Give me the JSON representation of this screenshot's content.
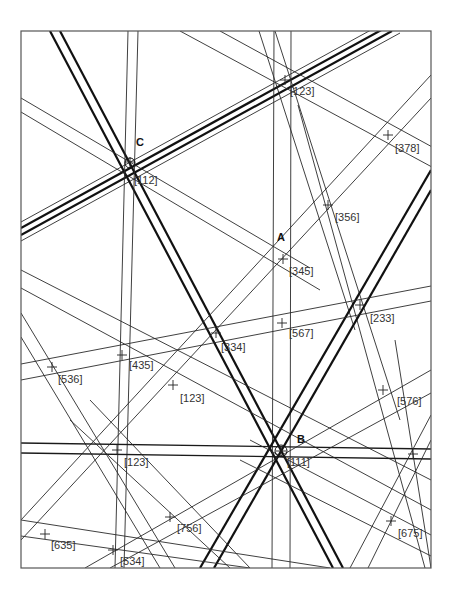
{
  "diagram": {
    "type": "kikuchi-map",
    "frame": {
      "x": 21,
      "y": 31,
      "width": 410,
      "height": 537
    },
    "poles": [
      {
        "id": "A",
        "label": "A",
        "x": 277,
        "y": 238
      },
      {
        "id": "B",
        "label": "B",
        "x": 297,
        "y": 440
      },
      {
        "id": "C",
        "label": "C",
        "x": 136,
        "y": 143
      }
    ],
    "zone_labels": [
      {
        "text": "[123]",
        "x": 290,
        "y": 95
      },
      {
        "text": "[378]",
        "x": 395,
        "y": 152
      },
      {
        "text": "[112]",
        "x": 134,
        "y": 184
      },
      {
        "text": "[356]",
        "x": 335,
        "y": 221
      },
      {
        "text": "[345]",
        "x": 289,
        "y": 275
      },
      {
        "text": "[233]",
        "x": 370,
        "y": 322
      },
      {
        "text": "[334]",
        "x": 221,
        "y": 351
      },
      {
        "text": "[567]",
        "x": 289,
        "y": 337
      },
      {
        "text": "[536]",
        "x": 58,
        "y": 383
      },
      {
        "text": "[435]",
        "x": 129,
        "y": 369
      },
      {
        "text": "[123]",
        "x": 180,
        "y": 402
      },
      {
        "text": "[576]",
        "x": 397,
        "y": 405
      },
      {
        "text": "[123]",
        "x": 124,
        "y": 466
      },
      {
        "text": "[111]",
        "x": 287,
        "y": 466
      },
      {
        "text": "[756]",
        "x": 177,
        "y": 532
      },
      {
        "text": "[675]",
        "x": 398,
        "y": 537
      },
      {
        "text": "[635]",
        "x": 51,
        "y": 549
      },
      {
        "text": "[534]",
        "x": 120,
        "y": 565
      }
    ]
  }
}
